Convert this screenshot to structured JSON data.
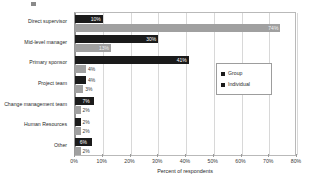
{
  "chart_data": {
    "type": "bar",
    "orientation": "horizontal",
    "title": "",
    "xlabel": "Percent of respondents",
    "ylabel": "",
    "xlim": [
      0,
      80
    ],
    "xticks": [
      "0%",
      "10%",
      "20%",
      "30%",
      "40%",
      "50%",
      "60%",
      "70%",
      "80%"
    ],
    "xtick_values": [
      0,
      10,
      20,
      30,
      40,
      50,
      60,
      70,
      80
    ],
    "grid": true,
    "legend_position": "right",
    "categories": [
      "Direct supervisor",
      "Mid-level manager",
      "Primary sponsor",
      "Project team",
      "Change management team",
      "Human Resources",
      "Other"
    ],
    "series": [
      {
        "name": "Group",
        "color": "#1b1b1b",
        "values": [
          10,
          30,
          41,
          4,
          7,
          2,
          6
        ],
        "labels": [
          "10%",
          "30%",
          "41%",
          "4%",
          "7%",
          "2%",
          "6%"
        ]
      },
      {
        "name": "Individual",
        "color": "#a0a0a0",
        "values": [
          74,
          13,
          4,
          3,
          2,
          2,
          2
        ],
        "labels": [
          "74%",
          "13%",
          "4%",
          "3%",
          "2%",
          "2%",
          "2%"
        ]
      }
    ]
  },
  "legend": {
    "items": [
      {
        "label": "Group",
        "marker": "legend-swatch-group"
      },
      {
        "label": "Individual",
        "marker": "legend-swatch-individual"
      }
    ]
  }
}
